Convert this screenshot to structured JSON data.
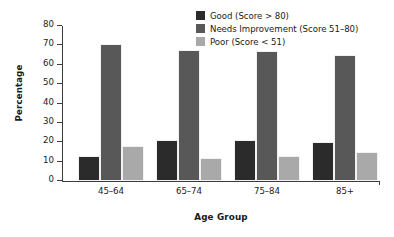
{
  "chart_data": {
    "type": "bar",
    "title": "",
    "xlabel": "Age Group",
    "ylabel": "Percentage",
    "categories": [
      "45–64",
      "65–74",
      "75–84",
      "85+"
    ],
    "ylim": [
      0,
      80
    ],
    "yticks": [
      0,
      10,
      20,
      30,
      40,
      50,
      60,
      70,
      80
    ],
    "ytick_labels": [
      "0",
      "10",
      "20",
      "30",
      "40",
      "50",
      "60",
      "70",
      "80"
    ],
    "grid": false,
    "legend_position": "top-right",
    "series": [
      {
        "name": "Good (Score > 80)",
        "color": "#2b2b2b",
        "values": [
          13,
          21,
          21,
          20
        ]
      },
      {
        "name": "Needs Improvement (Score 51–80)",
        "color": "#585858",
        "values": [
          70.5,
          67.5,
          67,
          65
        ]
      },
      {
        "name": "Poor (Score < 51)",
        "color": "#a9a9a9",
        "values": [
          18,
          12,
          13,
          15
        ]
      }
    ]
  },
  "colors": {
    "background": "#ffffff",
    "axis": "#3d3d3d",
    "text": "#1a1a1a"
  }
}
